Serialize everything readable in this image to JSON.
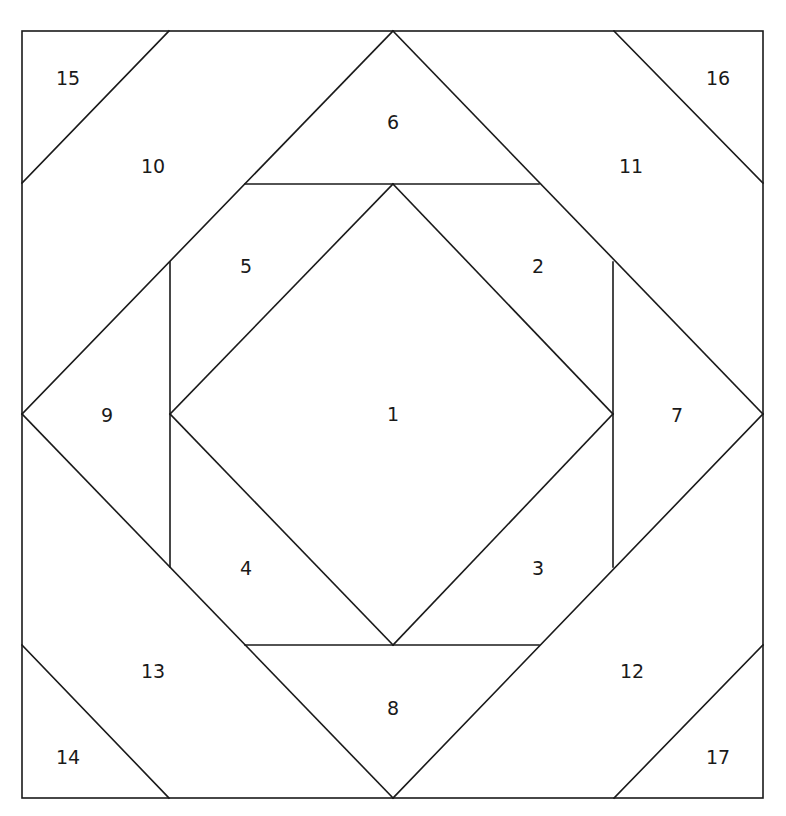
{
  "diagram": {
    "type": "quilt-block-piecing-pattern",
    "stroke_color": "#1a1a1a",
    "background": "#ffffff",
    "outer_square": {
      "x1": 22,
      "y1": 31,
      "x2": 763,
      "y2": 798
    },
    "lines": [
      [
        22,
        183,
        169,
        31
      ],
      [
        614,
        31,
        763,
        183
      ],
      [
        22,
        645,
        169,
        798
      ],
      [
        614,
        798,
        763,
        645
      ],
      [
        22,
        414,
        393,
        31
      ],
      [
        393,
        31,
        763,
        414
      ],
      [
        763,
        414,
        393,
        798
      ],
      [
        393,
        798,
        22,
        414
      ],
      [
        245,
        184,
        539,
        184
      ],
      [
        245,
        645,
        539,
        645
      ],
      [
        170,
        262,
        170,
        567
      ],
      [
        613,
        262,
        613,
        567
      ],
      [
        393,
        184,
        613,
        414
      ],
      [
        613,
        414,
        393,
        645
      ],
      [
        393,
        645,
        170,
        414
      ],
      [
        170,
        414,
        393,
        184
      ]
    ],
    "pieces": [
      {
        "id": "1",
        "x": 393,
        "y": 414
      },
      {
        "id": "2",
        "x": 538,
        "y": 266
      },
      {
        "id": "3",
        "x": 538,
        "y": 568
      },
      {
        "id": "4",
        "x": 246,
        "y": 568
      },
      {
        "id": "5",
        "x": 246,
        "y": 266
      },
      {
        "id": "6",
        "x": 393,
        "y": 122
      },
      {
        "id": "7",
        "x": 677,
        "y": 415
      },
      {
        "id": "8",
        "x": 393,
        "y": 708
      },
      {
        "id": "9",
        "x": 107,
        "y": 415
      },
      {
        "id": "10",
        "x": 153,
        "y": 166
      },
      {
        "id": "11",
        "x": 631,
        "y": 166
      },
      {
        "id": "12",
        "x": 632,
        "y": 671
      },
      {
        "id": "13",
        "x": 153,
        "y": 671
      },
      {
        "id": "14",
        "x": 68,
        "y": 757
      },
      {
        "id": "15",
        "x": 68,
        "y": 78
      },
      {
        "id": "16",
        "x": 718,
        "y": 78
      },
      {
        "id": "17",
        "x": 718,
        "y": 757
      }
    ]
  }
}
